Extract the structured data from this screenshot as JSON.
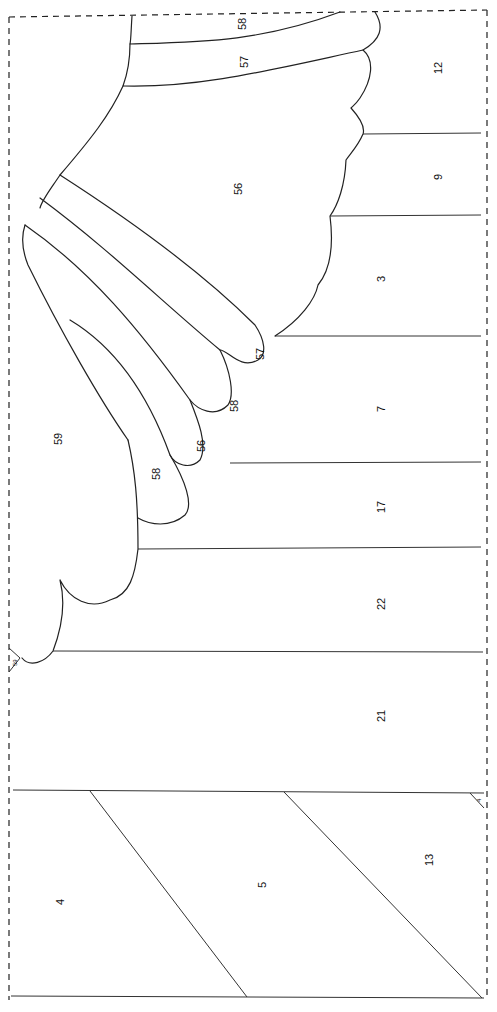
{
  "diagram": {
    "type": "numbered pattern (rotated 90°)",
    "labels": {
      "r58_top": "58",
      "r57_top": "57",
      "r56_big": "56",
      "r12": "12",
      "r9": "9",
      "r3": "3",
      "r57_feather": "57",
      "r58_feather": "58",
      "r56_feather": "56",
      "r58_feather2": "58",
      "r59": "59",
      "r59_small": "59",
      "r7": "7",
      "r17": "17",
      "r22": "22",
      "r21": "21",
      "r4": "4",
      "r5": "5",
      "r13": "13",
      "r4_small": "4"
    }
  }
}
